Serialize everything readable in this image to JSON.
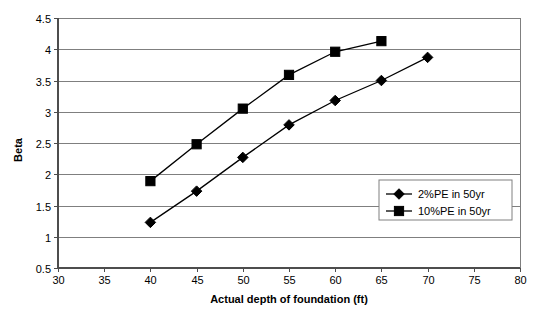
{
  "chart_data": {
    "type": "line",
    "title": "",
    "xlabel": "Actual depth of foundation (ft)",
    "ylabel": "Beta",
    "xlim": [
      30,
      80
    ],
    "ylim": [
      0.5,
      4.5
    ],
    "xticks": [
      30,
      35,
      40,
      45,
      50,
      55,
      60,
      65,
      70,
      75,
      80
    ],
    "yticks": [
      0.5,
      1,
      1.5,
      2,
      2.5,
      3,
      3.5,
      4,
      4.5
    ],
    "xtick_labels": [
      "30",
      "35",
      "40",
      "45",
      "50",
      "55",
      "60",
      "65",
      "70",
      "75",
      "80"
    ],
    "ytick_labels": [
      "0.5",
      "1",
      "1.5",
      "2",
      "2.5",
      "3",
      "3.5",
      "4",
      "4.5"
    ],
    "grid": "horizontal",
    "legend_position": "inside-right-lower",
    "series": [
      {
        "name": "2%PE in 50yr",
        "marker": "diamond",
        "color": "#000000",
        "x": [
          40,
          45,
          50,
          55,
          60,
          65,
          70
        ],
        "values": [
          1.23,
          1.73,
          2.27,
          2.79,
          3.18,
          3.5,
          3.87
        ]
      },
      {
        "name": "10%PE in 50yr",
        "marker": "square",
        "color": "#000000",
        "x": [
          40,
          45,
          50,
          55,
          60,
          65
        ],
        "values": [
          1.89,
          2.48,
          3.05,
          3.59,
          3.96,
          4.13
        ]
      }
    ]
  },
  "legend": {
    "entries": [
      {
        "label": "2%PE in 50yr",
        "marker": "diamond"
      },
      {
        "label": "10%PE in 50yr",
        "marker": "square"
      }
    ]
  },
  "axes": {
    "y_title": "Beta",
    "x_title": "Actual depth of foundation (ft)"
  }
}
